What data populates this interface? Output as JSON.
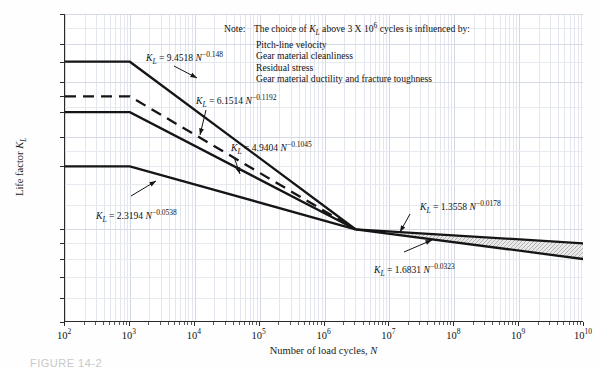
{
  "chart_data": {
    "type": "line",
    "title": "",
    "xlabel": "Number of load cycles, N",
    "ylabel": "Life factor K_L",
    "xscale": "log",
    "yscale": "log",
    "xlim": [
      100,
      10000000000
    ],
    "ylim": [
      0.5,
      5.0
    ],
    "grid": true,
    "legend": "none",
    "x_ticks": [
      "10^2",
      "10^3",
      "10^4",
      "10^5",
      "10^6",
      "10^7",
      "10^8",
      "10^9",
      "10^10"
    ],
    "y_ticks": [
      "5.0",
      "4.0",
      "3.0",
      "2.0",
      "1.0",
      "0.9",
      "0.8",
      "0.7",
      "0.6",
      "0.5"
    ],
    "y_named_ticks": [
      "400 Bhn",
      "Case carb.",
      "250 Bhn",
      "160 Bhn"
    ],
    "series": [
      {
        "name": "400 Bhn",
        "style": "solid",
        "equation": "K_L = 9.4518 N^-0.148",
        "plateau_value": 3.5,
        "plateau_until": 1000,
        "knee_x": 3000000,
        "knee_y": 1.0
      },
      {
        "name": "Case carb.",
        "style": "dashed",
        "equation": "K_L = 6.1514 N^-0.1192",
        "plateau_value": 2.7,
        "plateau_until": 1000,
        "knee_x": 3000000,
        "knee_y": 1.0
      },
      {
        "name": "250 Bhn",
        "style": "solid",
        "equation": "K_L = 4.9404 N^-0.1045",
        "plateau_value": 2.4,
        "plateau_until": 1000,
        "knee_x": 3000000,
        "knee_y": 1.0
      },
      {
        "name": "160 Bhn",
        "style": "solid",
        "equation": "K_L = 2.3194 N^-0.0538",
        "plateau_value": 1.6,
        "plateau_until": 1000,
        "knee_x": 3000000,
        "knee_y": 1.0
      },
      {
        "name": "upper band limit",
        "style": "solid",
        "equation": "K_L = 1.3558 N^-0.0178",
        "from_x": 3000000,
        "from_y": 1.0,
        "to_x": 10000000000,
        "to_y": 0.9
      },
      {
        "name": "lower band limit",
        "style": "solid",
        "equation": "K_L = 1.6831 N^-0.0323",
        "from_x": 3000000,
        "from_y": 1.0,
        "to_x": 10000000000,
        "to_y": 0.8
      }
    ],
    "shaded_band": {
      "between": [
        "upper band limit",
        "lower band limit"
      ],
      "from_x": 3000000,
      "to_x": 10000000000,
      "hatch": true
    },
    "annotations": [
      "K_L = 9.4518 N^-0.148",
      "K_L = 6.1514 N^-0.1192",
      "K_L = 4.9404 N^-0.1045",
      "K_L = 2.3194 N^-0.0538",
      "K_L = 1.3558 N^-0.0178",
      "K_L = 1.6831 N^-0.0323"
    ]
  },
  "axes": {
    "y_title_prefix": "Life factor ",
    "y_title_symbol": "K",
    "y_title_sub": "L",
    "x_title_prefix": "Number of load cycles, ",
    "x_title_symbol": "N",
    "y_ticks": [
      {
        "label": "5.0",
        "value": 5.0,
        "named": false
      },
      {
        "label": "4.0",
        "value": 4.0,
        "named": false
      },
      {
        "label": "400 Bhn",
        "value": 3.5,
        "named": true
      },
      {
        "label": "3.0",
        "value": 3.0,
        "named": false
      },
      {
        "label": "Case carb.",
        "value": 2.7,
        "named": true
      },
      {
        "label": "250 Bhn",
        "value": 2.4,
        "named": true
      },
      {
        "label": "2.0",
        "value": 2.0,
        "named": false
      },
      {
        "label": "160 Bhn",
        "value": 1.6,
        "named": true
      },
      {
        "label": "1.0",
        "value": 1.0,
        "named": false
      },
      {
        "label": "0.9",
        "value": 0.9,
        "named": false
      },
      {
        "label": "0.8",
        "value": 0.8,
        "named": false
      },
      {
        "label": "0.7",
        "value": 0.7,
        "named": false
      },
      {
        "label": "0.6",
        "value": 0.6,
        "named": false
      },
      {
        "label": "0.5",
        "value": 0.5,
        "named": false
      }
    ],
    "x_ticks": [
      {
        "base": "10",
        "exp": "2"
      },
      {
        "base": "10",
        "exp": "3"
      },
      {
        "base": "10",
        "exp": "4"
      },
      {
        "base": "10",
        "exp": "5"
      },
      {
        "base": "10",
        "exp": "6"
      },
      {
        "base": "10",
        "exp": "7"
      },
      {
        "base": "10",
        "exp": "8"
      },
      {
        "base": "10",
        "exp": "9"
      },
      {
        "base": "10",
        "exp": "10"
      }
    ]
  },
  "note": {
    "label": "Note:",
    "heading_pre": "The choice of ",
    "heading_sym": "K",
    "heading_sub": "L",
    "heading_post": " above 3 X 10",
    "heading_exp": "6",
    "heading_tail": " cycles is influenced by:",
    "items": [
      "Pitch-line velocity",
      "Gear material cleanliness",
      "Residual stress",
      "Gear material ductility and fracture toughness"
    ]
  },
  "equations": [
    {
      "id": "eq-400bhn",
      "pre": "K",
      "sub": "L",
      "mid": " = 9.4518 ",
      "var": "N",
      "exp": "−0.148"
    },
    {
      "id": "eq-casecarb",
      "pre": "K",
      "sub": "L",
      "mid": " = 6.1514 ",
      "var": "N",
      "exp": "−0.1192"
    },
    {
      "id": "eq-250bhn",
      "pre": "K",
      "sub": "L",
      "mid": " = 4.9404 ",
      "var": "N",
      "exp": "−0.1045"
    },
    {
      "id": "eq-160bhn",
      "pre": "K",
      "sub": "L",
      "mid": " = 2.3194 ",
      "var": "N",
      "exp": "−0.0538"
    },
    {
      "id": "eq-upper-band",
      "pre": "K",
      "sub": "L",
      "mid": " = 1.3558 ",
      "var": "N",
      "exp": "−0.0178"
    },
    {
      "id": "eq-lower-band",
      "pre": "K",
      "sub": "L",
      "mid": " = 1.6831 ",
      "var": "N",
      "exp": "−0.0323"
    }
  ],
  "caption": {
    "text": "FIGURE  14-2"
  }
}
